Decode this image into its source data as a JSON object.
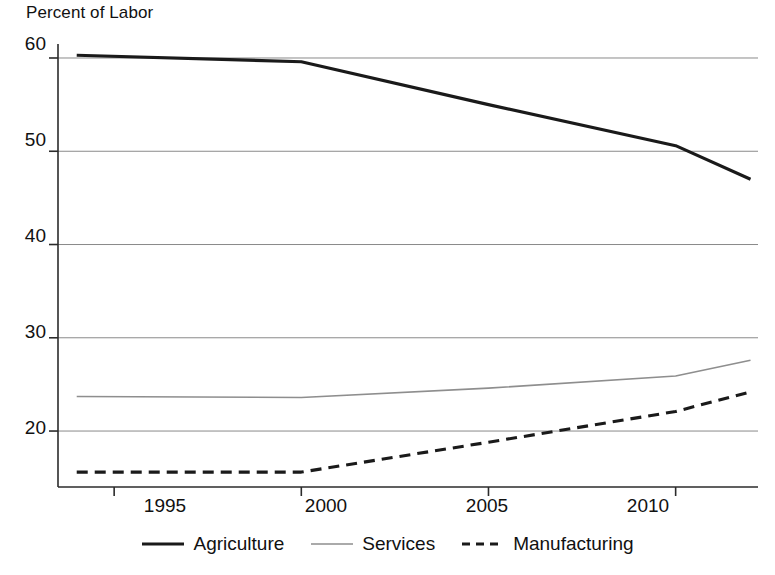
{
  "chart_data": {
    "type": "line",
    "title": "Percent of Labor",
    "xlabel": "",
    "ylabel": "Percent of Labor",
    "xlim": [
      1993.5,
      2012.2
    ],
    "ylim": [
      14.0,
      61.5
    ],
    "xticks": [
      1995,
      2000,
      2005,
      2010
    ],
    "yticks": [
      20,
      30,
      40,
      50,
      60
    ],
    "grid": true,
    "legend_position": "bottom",
    "x": [
      1994,
      2000,
      2005,
      2010,
      2012
    ],
    "series": [
      {
        "name": "Agriculture",
        "style": "solid-thick",
        "color": "#1a1a1a",
        "values": [
          60.3,
          59.6,
          55.0,
          50.6,
          47.0
        ]
      },
      {
        "name": "Services",
        "style": "solid-thin",
        "color": "#8e8e8e",
        "values": [
          23.7,
          23.6,
          24.6,
          25.9,
          27.6
        ]
      },
      {
        "name": "Manufacturing",
        "style": "dashed",
        "color": "#1a1a1a",
        "values": [
          15.6,
          15.6,
          18.8,
          22.1,
          24.2
        ]
      }
    ]
  },
  "axis": {
    "title": "Percent of Labor",
    "y_tick_labels": [
      "60",
      "50",
      "40",
      "30",
      "20"
    ],
    "x_tick_labels": [
      "1995",
      "2000",
      "2005",
      "2010"
    ]
  },
  "legend": {
    "items": [
      {
        "label": "Agriculture",
        "icon": "solid-thick-line-icon"
      },
      {
        "label": "Services",
        "icon": "solid-thin-line-icon"
      },
      {
        "label": "Manufacturing",
        "icon": "dashed-line-icon"
      }
    ]
  }
}
